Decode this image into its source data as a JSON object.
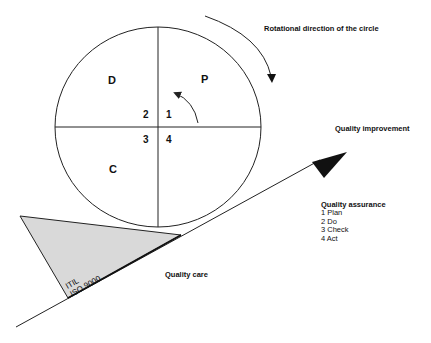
{
  "diagram": {
    "type": "pdca-circle-on-slope",
    "quadrants": {
      "top_left": "D",
      "top_right": "P",
      "bottom_left": "C",
      "bottom_right": "A"
    },
    "step_numbers": {
      "top_left": "2",
      "top_right": "1",
      "bottom_left": "3",
      "bottom_right": "4"
    },
    "labels": {
      "rotation": "Rotational direction of the circle",
      "improvement": "Quality improvement",
      "care": "Quality care",
      "wedge_line1": "ITIL",
      "wedge_line2": "ISO 9000"
    },
    "legend": {
      "title": "Quality assurance",
      "items": [
        "1 Plan",
        "2 Do",
        "3 Check",
        "4 Act"
      ]
    },
    "colors": {
      "line": "#222222",
      "wedge_fill": "#d9d9d9"
    }
  }
}
